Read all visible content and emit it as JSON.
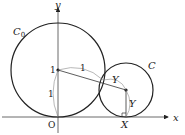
{
  "diagram": {
    "axes": {
      "x_label": "x",
      "y_label": "y",
      "origin_label": "O"
    },
    "circle_big": {
      "label": "C",
      "subscript": "0",
      "center_label": "1"
    },
    "circle_small": {
      "label": "C"
    },
    "segments": {
      "radius_big_label": "1",
      "radius_small_along_line_label": "Y",
      "vertical_radius_label": "Y",
      "arc_center_to_origin_label": "1",
      "foot_label": "X"
    },
    "colors": {
      "stroke": "#222222",
      "background": "#ffffff"
    }
  }
}
